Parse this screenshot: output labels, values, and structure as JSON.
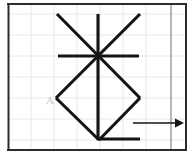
{
  "figure": {
    "canvas": {
      "width": 189,
      "height": 154
    },
    "background_color": "#ffffff",
    "labels": [
      {
        "name": "vertex-label-a",
        "text": "A",
        "x": 47,
        "y": 103,
        "color": "#c9c9c9"
      }
    ],
    "grid": {
      "minor_color": "#e8e8e8",
      "major_color": "#9a9a9a",
      "frame_color": "#2b2b2b",
      "vertical_minor": [
        31,
        54,
        77,
        100,
        123,
        146
      ],
      "vertical_major": [
        171
      ],
      "horizontal_minor": [
        14,
        35,
        56,
        77,
        98,
        119,
        140
      ],
      "frame": {
        "left": 8,
        "right": 186,
        "top": 4,
        "bottom": 150
      }
    },
    "shapes": {
      "stroke_color": "#141414",
      "center_point": {
        "x": 98,
        "y": 56
      },
      "lines": [
        {
          "name": "vertical-axis-line",
          "x1": 98,
          "y1": 14,
          "x2": 98,
          "y2": 140
        },
        {
          "name": "horizontal-axis-line",
          "x1": 58,
          "y1": 56,
          "x2": 139,
          "y2": 56
        },
        {
          "name": "diagonal-line-down-right",
          "x1": 57,
          "y1": 14,
          "x2": 140,
          "y2": 98
        },
        {
          "name": "diagonal-line-down-left",
          "x1": 140,
          "y1": 14,
          "x2": 56,
          "y2": 98
        },
        {
          "name": "diamond-side-lower-left",
          "x1": 56,
          "y1": 98,
          "x2": 99,
          "y2": 140
        },
        {
          "name": "diamond-side-lower-right",
          "x1": 140,
          "y1": 98,
          "x2": 99,
          "y2": 140
        },
        {
          "name": "base-horizontal-line",
          "x1": 99,
          "y1": 139,
          "x2": 140,
          "y2": 139
        }
      ],
      "arrow": {
        "name": "direction-arrow",
        "x1": 133,
        "y1": 123,
        "x2": 176,
        "y2": 123,
        "head_points": "176,118.5 184,123 176,127.5"
      }
    }
  }
}
